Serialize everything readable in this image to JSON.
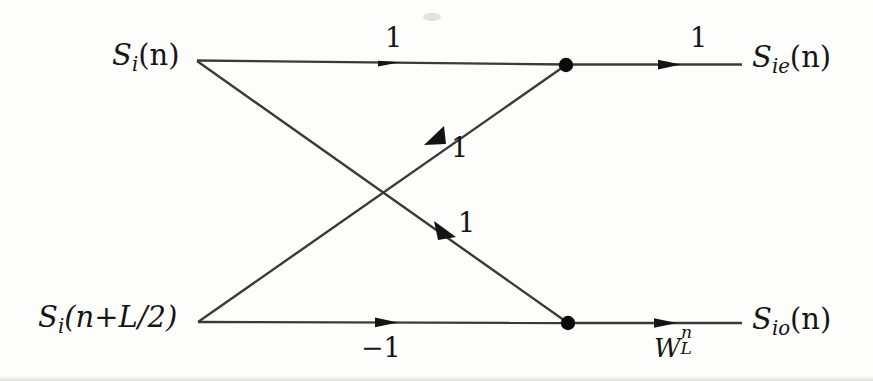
{
  "figure": {
    "type": "signal-flow-graph",
    "background_color": "#fdfdfb",
    "line_color": "#2b2b2b",
    "text_color": "#151515"
  },
  "nodes": {
    "input_top": {
      "label_parts": {
        "base": "S",
        "sub": "i",
        "arg": "(n)"
      },
      "label_text": "S_i(n)",
      "x": 197,
      "y": 60
    },
    "input_bottom": {
      "label_parts": {
        "base": "S",
        "sub": "i",
        "arg": "(n+L/2)"
      },
      "label_text": "S_i(n+L/2)",
      "x": 198,
      "y": 322
    },
    "junction_top": {
      "name": "summing-node-top",
      "x": 566,
      "y": 65,
      "dot_radius": 7
    },
    "junction_bottom": {
      "name": "summing-node-bottom",
      "x": 568,
      "y": 323,
      "dot_radius": 7
    },
    "output_top": {
      "label_parts": {
        "base": "S",
        "sub": "ie",
        "arg": "(n)"
      },
      "label_text": "S_ie(n)",
      "x": 740,
      "y": 65
    },
    "output_bottom": {
      "label_parts": {
        "base": "S",
        "sub": "io",
        "arg": "(n)"
      },
      "label_text": "S_io(n)",
      "x": 740,
      "y": 323
    }
  },
  "edges": [
    {
      "name": "edge-top-input-to-top-node",
      "from": "input_top",
      "to": "junction_top",
      "weight": "1",
      "arrow_at": {
        "x": 395,
        "y": 61
      },
      "label_position": "above"
    },
    {
      "name": "edge-top-input-to-bottom-node",
      "from": "input_top",
      "to": "junction_bottom",
      "weight": "1",
      "arrow_at": {
        "x": 470,
        "y": 250
      },
      "label_position": "above-right"
    },
    {
      "name": "edge-bottom-input-to-top-node",
      "from": "input_bottom",
      "to": "junction_top",
      "weight": "1",
      "arrow_at": {
        "x": 438,
        "y": 133
      },
      "label_position": "below-right"
    },
    {
      "name": "edge-bottom-input-to-bottom-node",
      "from": "input_bottom",
      "to": "junction_bottom",
      "weight": "-1",
      "arrow_at": {
        "x": 393,
        "y": 322
      },
      "label_position": "below"
    },
    {
      "name": "edge-top-node-to-top-output",
      "from": "junction_top",
      "to": "output_top",
      "weight": "1",
      "arrow_at": {
        "x": 676,
        "y": 65
      },
      "label_position": "above"
    },
    {
      "name": "edge-bottom-node-to-bottom-output",
      "from": "junction_bottom",
      "to": "output_bottom",
      "weight": "W_L^n",
      "weight_parts": {
        "base": "W",
        "sub": "L",
        "sup": "n"
      },
      "arrow_at": {
        "x": 672,
        "y": 323
      },
      "label_position": "below"
    }
  ],
  "weights": {
    "top_left": "1",
    "top_right": "1",
    "mid_upper": "1",
    "mid_lower": "1",
    "bottom_left": "−1",
    "twiddle_base": "W",
    "twiddle_sub": "L",
    "twiddle_sup": "n"
  },
  "labels": {
    "si_base": "S",
    "si_sub": "i",
    "si_arg": "(n)",
    "sinl2_base": "S",
    "sinl2_sub": "i",
    "sinl2_arg": "(n+L/2)",
    "sie_base": "S",
    "sie_sub": "ie",
    "sie_arg": "(n)",
    "sio_base": "S",
    "sio_sub": "io",
    "sio_arg": "(n)"
  }
}
